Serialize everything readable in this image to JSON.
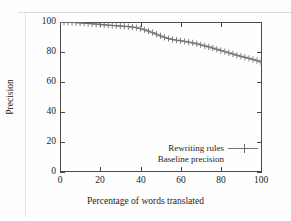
{
  "figure": {
    "kind": "line-plot",
    "background": "#fefefe",
    "ink": "#1d1d1d",
    "series_color": "#6e6e6e"
  },
  "axes": {
    "x": {
      "label": "Percentage of words translated",
      "ticks": [
        "0",
        "20",
        "40",
        "60",
        "80",
        "100"
      ],
      "min": 0,
      "max": 100
    },
    "y": {
      "label": "Precision",
      "ticks": [
        "0",
        "20",
        "40",
        "60",
        "80",
        "100"
      ],
      "min": 0,
      "max": 100
    }
  },
  "legend": {
    "position": "inside lower-right",
    "entries": [
      {
        "label": "Rewriting rules",
        "sample": "line-with-cross-marker"
      },
      {
        "label": "Baseline precision",
        "sample": "none"
      }
    ]
  },
  "chart_data": {
    "type": "line",
    "title": "",
    "xlabel": "Percentage of words translated",
    "ylabel": "Precision",
    "xlim": [
      0,
      100
    ],
    "ylim": [
      0,
      100
    ],
    "grid": false,
    "legend_position": "lower right (inside plot)",
    "marker": "plus",
    "series": [
      {
        "name": "Rewriting rules",
        "marker": "plus",
        "x": [
          0,
          2,
          4,
          6,
          8,
          10,
          12,
          14,
          16,
          18,
          20,
          22,
          24,
          26,
          28,
          30,
          32,
          34,
          36,
          38,
          40,
          42,
          44,
          46,
          48,
          50,
          52,
          54,
          56,
          58,
          60,
          62,
          64,
          66,
          68,
          70,
          72,
          74,
          76,
          78,
          80,
          82,
          84,
          86,
          88,
          90,
          92,
          94,
          96,
          98,
          100
        ],
        "values": [
          100,
          99.9,
          99.8,
          99.7,
          99.6,
          99.4,
          99.2,
          99.0,
          98.8,
          98.6,
          98.4,
          98.1,
          97.9,
          97.7,
          97.5,
          97.3,
          97.1,
          96.9,
          96.6,
          96.2,
          95.6,
          94.8,
          93.9,
          92.9,
          91.8,
          90.7,
          89.7,
          88.9,
          88.3,
          87.8,
          87.4,
          87.0,
          86.5,
          86.0,
          85.4,
          84.7,
          84.0,
          83.3,
          82.5,
          81.7,
          80.9,
          80.1,
          79.3,
          78.5,
          77.7,
          77.0,
          76.3,
          75.6,
          74.9,
          74.1,
          73.2
        ]
      },
      {
        "name": "Baseline precision",
        "marker": "none",
        "x": [],
        "values": []
      }
    ]
  }
}
